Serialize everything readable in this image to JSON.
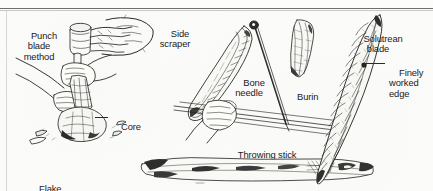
{
  "page": {
    "kind": "scanned-illustration",
    "background_color": "#fcfcfa",
    "ink_color": "#1b1b1b",
    "rule_color": "#6e6e6e"
  },
  "labels": {
    "punch_blade_method": "Punch\nblade\nmethod",
    "core": "Core",
    "flake": "Flake",
    "side_scraper": "Side\nscraper",
    "bone_needle": "Bone\nneedle",
    "burin": "Burin",
    "solutrean_blade": "Solutrean\nblade",
    "finely_worked_edge": "Finely\nworked\nedge",
    "throwing_stick": "Throwing stick"
  },
  "figures": [
    {
      "name": "hand-holding-antler-punch",
      "caption_ref": "punch_blade_method"
    },
    {
      "name": "hands-striking-core-with-punch",
      "caption_ref": "core"
    },
    {
      "name": "stone-core-on-ground",
      "caption_ref": "core"
    },
    {
      "name": "detached-flakes",
      "caption_ref": "flake"
    },
    {
      "name": "side-scraper-tool",
      "caption_ref": "side_scraper"
    },
    {
      "name": "bone-needle-tool",
      "caption_ref": "bone_needle"
    },
    {
      "name": "burin-tool",
      "caption_ref": "burin"
    },
    {
      "name": "solutrean-laurel-leaf-blade",
      "caption_ref": "solutrean_blade"
    },
    {
      "name": "hand-holding-throwing-stick",
      "caption_ref": "throwing_stick"
    },
    {
      "name": "throwing-stick-atlatl",
      "caption_ref": "throwing_stick"
    }
  ]
}
